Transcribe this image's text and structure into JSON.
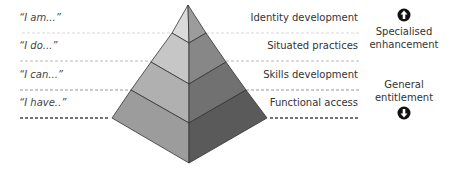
{
  "diagram": {
    "type": "pyramid",
    "levels": [
      {
        "left_label": "“I am...”",
        "right_label": "Identity development",
        "face_left": "#d9d9d9",
        "face_right": "#9a9a9a"
      },
      {
        "left_label": "“I do...”",
        "right_label": "Situated practices",
        "face_left": "#c7c7c7",
        "face_right": "#858585"
      },
      {
        "left_label": "“I can...”",
        "right_label": "Skills development",
        "face_left": "#b1b1b1",
        "face_right": "#707070"
      },
      {
        "left_label": "“I have..”",
        "right_label": "Functional access",
        "face_left": "#9d9d9d",
        "face_right": "#5a5a5a"
      }
    ],
    "side_top": {
      "label_line1": "Specialised",
      "label_line2": "enhancement",
      "icon": "arrow-up-circle-icon"
    },
    "side_bottom": {
      "label_line1": "General",
      "label_line2": "entitlement",
      "icon": "arrow-down-circle-icon"
    }
  }
}
